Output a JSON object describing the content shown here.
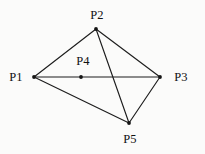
{
  "figure": {
    "background_color": "#fbfbfa",
    "stroke_color": "#1d1d1d",
    "label_color": "#111111",
    "width": 205,
    "height": 154
  },
  "chart_data": {
    "type": "diagram",
    "title": "",
    "xlabel": "",
    "ylabel": "",
    "grid": false,
    "legend": null,
    "nodes": [
      {
        "id": "P1",
        "label": "P1",
        "x": 34,
        "y": 77,
        "label_x": 16,
        "label_y": 77,
        "label_position": "left"
      },
      {
        "id": "P2",
        "label": "P2",
        "x": 96,
        "y": 29,
        "label_x": 97,
        "label_y": 15,
        "label_position": "above"
      },
      {
        "id": "P3",
        "label": "P3",
        "x": 160,
        "y": 77,
        "label_x": 181,
        "label_y": 77,
        "label_position": "right"
      },
      {
        "id": "P4",
        "label": "P4",
        "x": 81,
        "y": 77,
        "label_x": 83,
        "label_y": 61,
        "label_position": "above"
      },
      {
        "id": "P5",
        "label": "P5",
        "x": 129,
        "y": 123,
        "label_x": 130,
        "label_y": 139,
        "label_position": "below"
      }
    ],
    "edges": [
      {
        "id": "e1",
        "from": "P1",
        "to": "P2"
      },
      {
        "id": "e2",
        "from": "P2",
        "to": "P3"
      },
      {
        "id": "e3",
        "from": "P1",
        "to": "P3"
      },
      {
        "id": "e4",
        "from": "P1",
        "to": "P5"
      },
      {
        "id": "e5",
        "from": "P3",
        "to": "P5"
      },
      {
        "id": "e6",
        "from": "P2",
        "to": "P5"
      }
    ],
    "edge_count": 6,
    "node_count": 5
  }
}
